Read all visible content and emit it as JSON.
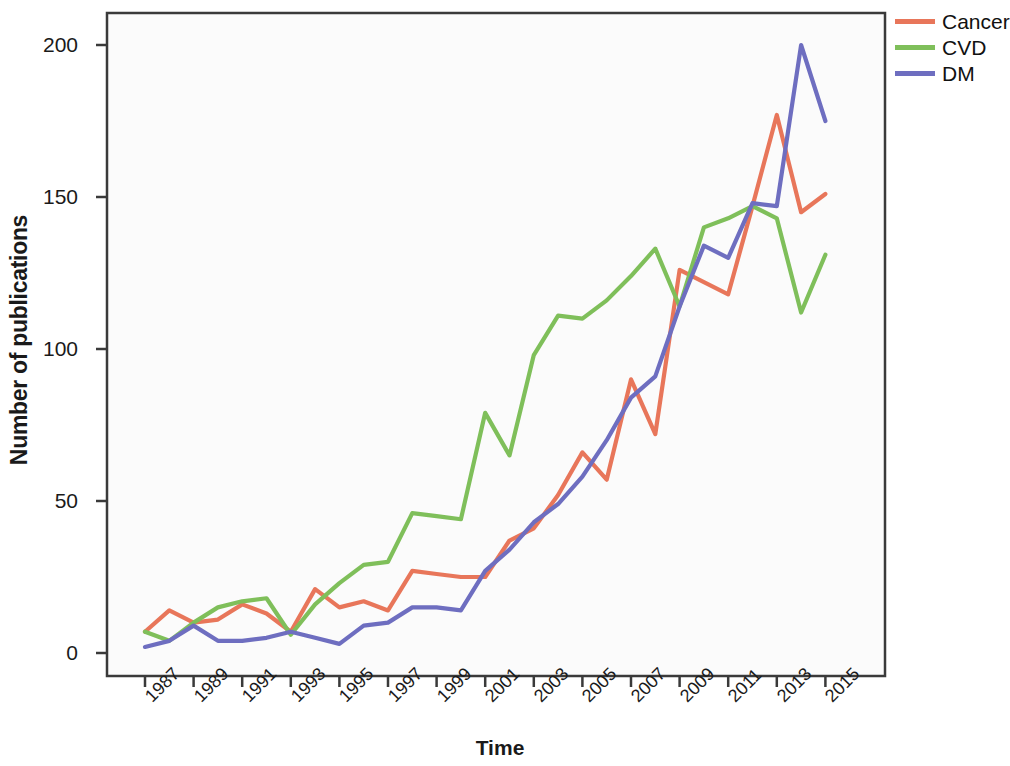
{
  "chart_data": {
    "type": "line",
    "title": "",
    "xlabel": "Time",
    "ylabel": "Number of publications",
    "x": [
      1987,
      1988,
      1989,
      1990,
      1991,
      1992,
      1993,
      1994,
      1995,
      1996,
      1997,
      1998,
      1999,
      2000,
      2001,
      2002,
      2003,
      2004,
      2005,
      2006,
      2007,
      2008,
      2009,
      2010,
      2011,
      2012,
      2013,
      2014,
      2015
    ],
    "xtick_labels": [
      "1987",
      "1989",
      "1991",
      "1993",
      "1995",
      "1997",
      "1999",
      "2001",
      "2003",
      "2005",
      "2007",
      "2009",
      "2011",
      "2013",
      "2015"
    ],
    "xticks": [
      1987,
      1989,
      1991,
      1993,
      1995,
      1997,
      1999,
      2001,
      2003,
      2005,
      2007,
      2009,
      2011,
      2013,
      2015
    ],
    "ytick_labels": [
      "0",
      "50",
      "100",
      "150",
      "200"
    ],
    "yticks": [
      0,
      50,
      100,
      150,
      200
    ],
    "xlim": [
      1986,
      2016
    ],
    "ylim": [
      0,
      215
    ],
    "grid": false,
    "legend_position": "top-right",
    "series": [
      {
        "name": "Cancer",
        "color": "#E8765A",
        "values": [
          7,
          14,
          10,
          11,
          16,
          13,
          7,
          21,
          15,
          17,
          14,
          27,
          26,
          25,
          25,
          37,
          41,
          52,
          66,
          57,
          90,
          72,
          126,
          122,
          118,
          147,
          177,
          145,
          151
        ]
      },
      {
        "name": "CVD",
        "color": "#7FBF5A",
        "values": [
          7,
          4,
          10,
          15,
          17,
          18,
          6,
          16,
          23,
          29,
          30,
          46,
          45,
          44,
          79,
          65,
          98,
          111,
          110,
          116,
          124,
          133,
          114,
          140,
          143,
          147,
          143,
          112,
          131
        ]
      },
      {
        "name": "DM",
        "color": "#6E6EC0",
        "values": [
          2,
          4,
          9,
          4,
          4,
          5,
          7,
          5,
          3,
          9,
          10,
          15,
          15,
          14,
          27,
          34,
          43,
          49,
          58,
          70,
          84,
          91,
          114,
          134,
          130,
          148,
          147,
          200,
          175
        ]
      }
    ]
  },
  "legend": {
    "items": [
      {
        "label": "Cancer",
        "color": "#E8765A"
      },
      {
        "label": "CVD",
        "color": "#7FBF5A"
      },
      {
        "label": "DM",
        "color": "#6E6EC0"
      }
    ]
  }
}
